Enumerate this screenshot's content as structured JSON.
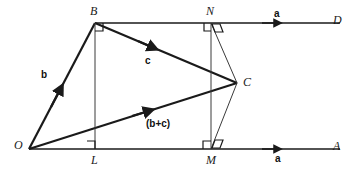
{
  "figure": {
    "kind": "geometry-diagram",
    "colors": {
      "ink": "#1a1a1a",
      "thin": "#3a3a3a",
      "background": "#ffffff"
    }
  },
  "points": {
    "O": {
      "label": "O",
      "x": 29,
      "y": 149
    },
    "B": {
      "label": "B",
      "x": 95,
      "y": 23
    },
    "C": {
      "label": "C",
      "x": 237,
      "y": 83
    },
    "D": {
      "label": "D",
      "x": 340,
      "y": 23
    },
    "A": {
      "label": "A",
      "x": 340,
      "y": 149
    },
    "L": {
      "label": "L",
      "x": 95,
      "y": 149
    },
    "M": {
      "label": "M",
      "x": 211,
      "y": 149
    },
    "N": {
      "label": "N",
      "x": 211,
      "y": 23
    }
  },
  "vectors": {
    "a_top": {
      "label": "a",
      "x": 274,
      "y": 11
    },
    "a_bottom": {
      "label": "a",
      "x": 275,
      "y": 155
    },
    "b": {
      "label": "b",
      "x": 41,
      "y": 72
    },
    "c": {
      "label": "c",
      "x": 145,
      "y": 57
    },
    "b_plus_c": {
      "label": "(b+c)",
      "x": 146,
      "y": 119
    }
  },
  "point_labels": {
    "O": {
      "text": "O",
      "x": 14,
      "y": 139
    },
    "B": {
      "text": "B",
      "x": 90,
      "y": 5
    },
    "C": {
      "text": "C",
      "x": 243,
      "y": 76
    },
    "D": {
      "text": "D",
      "x": 333,
      "y": 14
    },
    "A": {
      "text": "A",
      "x": 333,
      "y": 140
    },
    "L": {
      "text": "L",
      "x": 91,
      "y": 154
    },
    "M": {
      "text": "M",
      "x": 206,
      "y": 154
    },
    "N": {
      "text": "N",
      "x": 206,
      "y": 5
    }
  },
  "right_angles": [
    {
      "at": "B",
      "name": "right-angle-mark-b"
    },
    {
      "at": "L",
      "name": "right-angle-mark-l"
    },
    {
      "at": "N-vertical",
      "name": "right-angle-mark-n-vertical"
    },
    {
      "at": "N-slant",
      "name": "right-angle-mark-n-slant"
    },
    {
      "at": "M-vertical",
      "name": "right-angle-mark-m-vertical"
    },
    {
      "at": "M-slant",
      "name": "right-angle-mark-m-slant"
    }
  ]
}
